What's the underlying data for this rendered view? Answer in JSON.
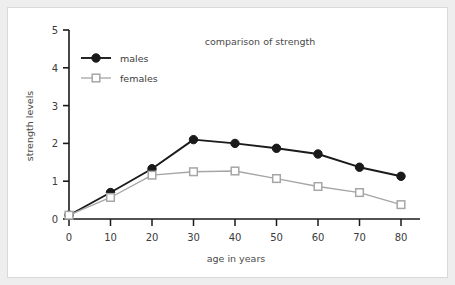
{
  "chart_data": {
    "type": "line",
    "title": "comparison of strength",
    "xlabel": "age in years",
    "ylabel": "strength levels",
    "x": [
      0,
      10,
      20,
      30,
      40,
      50,
      60,
      70,
      80
    ],
    "xticklabels": [
      "0",
      "10",
      "20",
      "30",
      "40",
      "50",
      "60",
      "70",
      "80"
    ],
    "yticklabels": [
      "0",
      "1",
      "2",
      "3",
      "4",
      "5"
    ],
    "xlim": [
      0,
      80
    ],
    "ylim": [
      0,
      5
    ],
    "grid": false,
    "legend_position": "top-left",
    "series": [
      {
        "name": "males",
        "color": "#1a1a1a",
        "marker": "filled-circle",
        "values": [
          0.1,
          0.7,
          1.33,
          2.1,
          2.0,
          1.87,
          1.72,
          1.37,
          1.13
        ]
      },
      {
        "name": "females",
        "color": "#a6a6a6",
        "marker": "open-square",
        "values": [
          0.1,
          0.57,
          1.16,
          1.25,
          1.27,
          1.07,
          0.86,
          0.7,
          0.38
        ]
      }
    ]
  },
  "style": {
    "axis_color": "#1a1a1a",
    "frame_color": "#eeeeee",
    "card_border": "#d9d9d9",
    "background": "#ffffff"
  }
}
